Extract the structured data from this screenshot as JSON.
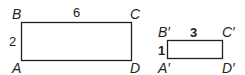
{
  "diagram": {
    "original": {
      "vertices": {
        "A": "A",
        "B": "B",
        "C": "C",
        "D": "D"
      },
      "width_label": "6",
      "height_label": "2"
    },
    "image": {
      "vertices": {
        "A": "A′",
        "B": "B′",
        "C": "C′",
        "D": "D′"
      },
      "width_label": "3",
      "height_label": "1"
    }
  }
}
